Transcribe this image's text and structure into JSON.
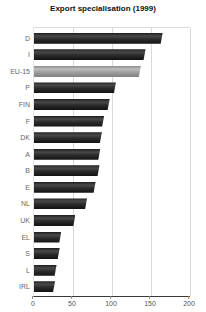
{
  "title": "Export specialisation (1999)",
  "colors": {
    "bar": "#2a2a2a",
    "eu_bar": "#9e9e9e",
    "label": "#666666",
    "tick_label": "#555555",
    "gridline": "#d9d9d9",
    "axis": "#3a3a3a"
  },
  "chart_data": {
    "type": "bar",
    "orientation": "horizontal",
    "title": "Export specialisation (1999)",
    "categories": [
      "D",
      "I",
      "EU-15",
      "P",
      "FIN",
      "F",
      "DK",
      "A",
      "B",
      "E",
      "NL",
      "UK",
      "EL",
      "S",
      "L",
      "IRL"
    ],
    "values": [
      165,
      143,
      137,
      105,
      97,
      90,
      87,
      85,
      84,
      79,
      68,
      53,
      35,
      33,
      29,
      27
    ],
    "highlight_category": "EU-15",
    "xlabel": "",
    "ylabel": "",
    "xlim": [
      0,
      200
    ],
    "x_ticks": [
      0,
      50,
      100,
      150,
      200
    ],
    "grid": true,
    "legend": false
  }
}
